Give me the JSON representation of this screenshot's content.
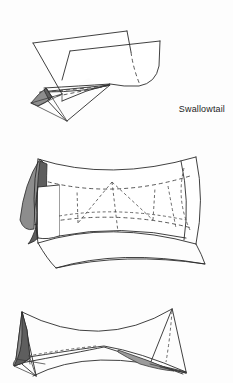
{
  "page": {
    "background_color": "#fdfdfd",
    "ink_color": "#2b2b2b",
    "figure_count": 3
  },
  "figures": [
    {
      "id": "swallowtail",
      "caption": "Swallowtail",
      "caption_align": "right",
      "has_caption": true,
      "shading_colors": [
        "#8d8d8d",
        "#5e5e5e"
      ],
      "line_styles": [
        "solid",
        "dashed-hidden"
      ],
      "description": "Swallowtail catastrophe surface with self-intersecting pleat and cusp-edged tail"
    },
    {
      "id": "elliptic-umbilic",
      "caption": "Elliptic Umbilic",
      "caption_align": "right",
      "has_caption": true,
      "shading_colors": [
        "#8d8d8d",
        "#5e5e5e"
      ],
      "line_styles": [
        "solid",
        "dashed-hidden"
      ],
      "description": "Elliptic umbilic catastrophe surface, barrel-like body with shaded fold on the left end"
    },
    {
      "id": "hyperbolic-umbilic",
      "caption": "",
      "caption_align": "right",
      "has_caption": false,
      "shading_colors": [
        "#7d7d7d",
        "#5e5e5e"
      ],
      "line_styles": [
        "solid",
        "dashed-hidden"
      ],
      "description": "Lower catastrophe surface cropped by the bottom edge, two cusped wings joined by a saddle"
    }
  ]
}
